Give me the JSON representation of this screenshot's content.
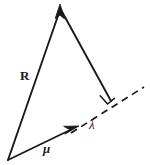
{
  "figure": {
    "background_color": "#ffffff",
    "stroke_color": "#1a1a1a",
    "labels": {
      "resultant_vector": "R",
      "mean_vector": "μ",
      "projection_length": "λ"
    },
    "elements": {
      "right_angle_marker": "right-angle",
      "dashed_axis": "dashed-extension-line",
      "arrowhead_top": "arrowhead-up",
      "arrowhead_mu": "arrowhead-right"
    },
    "geometry": {
      "origin": [
        8,
        160
      ],
      "apex": [
        60,
        6
      ],
      "foot_of_perpendicular": [
        110,
        100
      ],
      "mu_tip": [
        78,
        127
      ],
      "dash_start": [
        70,
        133
      ],
      "dash_end": [
        144,
        87
      ]
    }
  }
}
